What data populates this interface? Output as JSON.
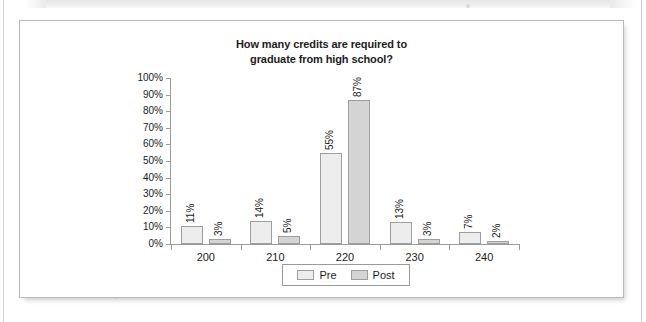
{
  "chart_data": {
    "type": "bar",
    "title": "How many credits are required to graduate from high school?",
    "title_line1": "How many credits are required to",
    "title_line2": "graduate from high school?",
    "categories": [
      "200",
      "210",
      "220",
      "230",
      "240"
    ],
    "series": [
      {
        "name": "Pre",
        "values": [
          11,
          14,
          55,
          13,
          7
        ],
        "color": "#ededed",
        "labels": [
          "11%",
          "14%",
          "55%",
          "13%",
          "7%"
        ]
      },
      {
        "name": "Post",
        "values": [
          3,
          5,
          87,
          3,
          2
        ],
        "color": "#d4d4d4",
        "labels": [
          "3%",
          "5%",
          "87%",
          "3%",
          "2%"
        ]
      }
    ],
    "xlabel": "",
    "ylabel": "",
    "ylim": [
      0,
      100
    ],
    "yticks": [
      0,
      10,
      20,
      30,
      40,
      50,
      60,
      70,
      80,
      90,
      100
    ],
    "ytick_labels": [
      "0%",
      "10%",
      "20%",
      "30%",
      "40%",
      "50%",
      "60%",
      "70%",
      "80%",
      "90%",
      "100%"
    ],
    "grid": false,
    "legend_position": "bottom",
    "value_labels_rotated": true,
    "value_label_unit": "%"
  },
  "legend": {
    "entries": [
      {
        "label": "Pre"
      },
      {
        "label": "Post"
      }
    ]
  },
  "colors": {
    "pre_bar": "#ededed",
    "post_bar": "#d4d4d4",
    "bar_outline": "#9e9e9e",
    "axis": "#9a9a9a",
    "text": "#1c1c1c",
    "card_border": "#b9b9b9",
    "page_background": "#ffffff"
  }
}
